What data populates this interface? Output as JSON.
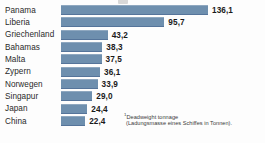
{
  "chart_data": {
    "type": "bar",
    "orientation": "horizontal",
    "title": "",
    "xlabel": "",
    "ylabel": "",
    "xlim": [
      0,
      136.1
    ],
    "grid": false,
    "legend": null,
    "value_format": "german-decimal-comma",
    "categories": [
      "Panama",
      "Liberia",
      "Griechenland",
      "Bahamas",
      "Malta",
      "Zypern",
      "Norwegen",
      "Singapur",
      "Japan",
      "China"
    ],
    "values": [
      136.1,
      95.7,
      43.2,
      38.3,
      37.5,
      36.1,
      33.9,
      29.0,
      24.4,
      22.4
    ],
    "value_labels": [
      "136,1",
      "95,7",
      "43,2",
      "38,3",
      "37,5",
      "36,1",
      "33,9",
      "29,0",
      "24,4",
      "22,4"
    ],
    "annotations": {
      "footnote_marker": "1",
      "footnote_line1": "Deadweight tonnage",
      "footnote_line2": "(Ladungsmasse eines Schiffes in Tonnen)."
    },
    "colors": {
      "bar": "#6e8fae",
      "bar_top_edge": "#8fa8c0",
      "bar_bottom_edge": "#55749a",
      "text": "#1d1d1d",
      "background": "#fdfdfd"
    }
  },
  "rows": [
    {
      "label": "Panama",
      "value": "136,1"
    },
    {
      "label": "Liberia",
      "value": "95,7"
    },
    {
      "label": "Griechenland",
      "value": "43,2"
    },
    {
      "label": "Bahamas",
      "value": "38,3"
    },
    {
      "label": "Malta",
      "value": "37,5"
    },
    {
      "label": "Zypern",
      "value": "36,1"
    },
    {
      "label": "Norwegen",
      "value": "33,9"
    },
    {
      "label": "Singapur",
      "value": "29,0"
    },
    {
      "label": "Japan",
      "value": "24,4"
    },
    {
      "label": "China",
      "value": "22,4"
    }
  ],
  "footnote": {
    "marker": "1",
    "line1": "Deadweight tonnage",
    "line2": "(Ladungsmasse eines Schiffes in Tonnen)."
  }
}
